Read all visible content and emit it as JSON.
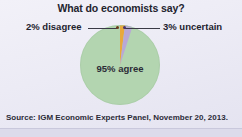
{
  "chart_data": {
    "type": "pie",
    "title": "What do economists say?",
    "categories": [
      "agree",
      "disagree",
      "uncertain"
    ],
    "values": [
      95,
      2,
      3
    ],
    "labels": [
      "95% agree",
      "2% disagree",
      "3% uncertain"
    ],
    "colors": [
      "#b3d5b0",
      "#e8a93c",
      "#b9a8d6"
    ],
    "legend_position": "callouts",
    "grid": false,
    "xlabel": "",
    "ylabel": "",
    "annotations": [
      "2% disagree",
      "3% uncertain",
      "95% agree"
    ],
    "source": "Source: IGM Economic Experts Panel, November 20, 2013."
  },
  "figure": {
    "title": "What do economists say?",
    "source_note": "Source: IGM Economic Experts Panel, November 20, 2013.",
    "background_color": "#eceaf5"
  },
  "slices": {
    "agree": {
      "label": "95% agree",
      "percent": 95,
      "color": "#b3d5b0"
    },
    "disagree": {
      "label": "2% disagree",
      "percent": 2,
      "color": "#e8a93c"
    },
    "uncertain": {
      "label": "3% uncertain",
      "percent": 3,
      "color": "#b9a8d6"
    }
  }
}
